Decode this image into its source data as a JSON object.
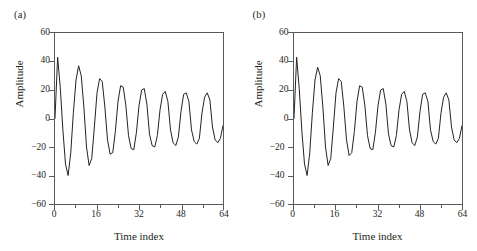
{
  "figure": {
    "panel_count": 2,
    "background_color": "#ffffff",
    "line_color": "#231f20",
    "axis_color": "#58595b"
  },
  "panels": [
    {
      "tag": "(a)",
      "chart_ref": 0
    },
    {
      "tag": "(b)",
      "chart_ref": 1
    }
  ],
  "chart_data": [
    {
      "type": "line",
      "title": "(a)",
      "xlabel": "Time index",
      "ylabel": "Amplitude",
      "xlim": [
        0,
        64
      ],
      "ylim": [
        -60,
        60
      ],
      "xticks": [
        0,
        16,
        32,
        48,
        64
      ],
      "xtick_labels": [
        "0",
        "16",
        "32",
        "48",
        "64"
      ],
      "xminor_ticks": [
        8,
        24,
        40,
        56
      ],
      "yticks": [
        -60,
        -40,
        -20,
        0,
        20,
        40,
        60
      ],
      "ytick_labels": [
        "−60",
        "−40",
        "−20",
        "0",
        "20",
        "40",
        "60"
      ],
      "grid": false,
      "legend": null,
      "x": [
        0,
        1,
        2,
        3,
        4,
        5,
        6,
        7,
        8,
        9,
        10,
        11,
        12,
        13,
        14,
        15,
        16,
        17,
        18,
        19,
        20,
        21,
        22,
        23,
        24,
        25,
        26,
        27,
        28,
        29,
        30,
        31,
        32,
        33,
        34,
        35,
        36,
        37,
        38,
        39,
        40,
        41,
        42,
        43,
        44,
        45,
        46,
        47,
        48,
        49,
        50,
        51,
        52,
        53,
        54,
        55,
        56,
        57,
        58,
        59,
        60,
        61,
        62,
        63,
        64
      ],
      "values": [
        0,
        43,
        22,
        -8,
        -32,
        -40,
        -24,
        4,
        27,
        37,
        30,
        8,
        -20,
        -33,
        -28,
        -6,
        18,
        28,
        26,
        8,
        -15,
        -25,
        -24,
        -9,
        12,
        23,
        22,
        9,
        -12,
        -21,
        -22,
        -10,
        9,
        20,
        21,
        10,
        -11,
        -19,
        -20,
        -12,
        6,
        17,
        19,
        12,
        -8,
        -17,
        -19,
        -13,
        5,
        17,
        18,
        12,
        -8,
        -16,
        -18,
        -14,
        4,
        15,
        18,
        13,
        -6,
        -15,
        -17,
        -14,
        -5
      ]
    },
    {
      "type": "line",
      "title": "(b)",
      "xlabel": "Time index",
      "ylabel": "Amplitude",
      "xlim": [
        0,
        64
      ],
      "ylim": [
        -60,
        60
      ],
      "xticks": [
        0,
        16,
        32,
        48,
        64
      ],
      "xtick_labels": [
        "0",
        "16",
        "32",
        "48",
        "64"
      ],
      "xminor_ticks": [
        8,
        24,
        40,
        56
      ],
      "yticks": [
        -60,
        -40,
        -20,
        0,
        20,
        40,
        60
      ],
      "ytick_labels": [
        "−60",
        "−40",
        "−20",
        "0",
        "20",
        "40",
        "60"
      ],
      "grid": false,
      "legend": null,
      "x": [
        0,
        1,
        2,
        3,
        4,
        5,
        6,
        7,
        8,
        9,
        10,
        11,
        12,
        13,
        14,
        15,
        16,
        17,
        18,
        19,
        20,
        21,
        22,
        23,
        24,
        25,
        26,
        27,
        28,
        29,
        30,
        31,
        32,
        33,
        34,
        35,
        36,
        37,
        38,
        39,
        40,
        41,
        42,
        43,
        44,
        45,
        46,
        47,
        48,
        49,
        50,
        51,
        52,
        53,
        54,
        55,
        56,
        57,
        58,
        59,
        60,
        61,
        62,
        63,
        64
      ],
      "values": [
        0,
        43,
        21,
        -9,
        -32,
        -40,
        -24,
        4,
        27,
        36,
        30,
        8,
        -20,
        -33,
        -28,
        -6,
        18,
        28,
        26,
        8,
        -15,
        -26,
        -24,
        -9,
        12,
        23,
        22,
        9,
        -12,
        -21,
        -22,
        -10,
        9,
        20,
        21,
        10,
        -11,
        -19,
        -20,
        -12,
        6,
        17,
        19,
        12,
        -8,
        -17,
        -19,
        -13,
        5,
        17,
        18,
        12,
        -8,
        -16,
        -18,
        -14,
        4,
        15,
        18,
        13,
        -6,
        -15,
        -17,
        -14,
        -5
      ]
    }
  ]
}
